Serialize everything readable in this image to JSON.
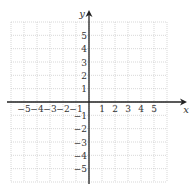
{
  "diagram": {
    "type": "coordinate-grid",
    "x_axis_label": "x",
    "y_axis_label": "y",
    "x_ticks": [
      "-5",
      "-4",
      "-3",
      "-2",
      "-1",
      "1",
      "2",
      "3",
      "4",
      "5"
    ],
    "y_ticks": [
      "5",
      "4",
      "3",
      "2",
      "1",
      "-1",
      "-2",
      "-3",
      "-4",
      "-5"
    ],
    "grid_range": {
      "x": [
        -6,
        6
      ],
      "y": [
        -6,
        6
      ]
    },
    "colors": {
      "grid": "#b8b8b8",
      "axis": "#222222",
      "text": "#333333"
    }
  }
}
